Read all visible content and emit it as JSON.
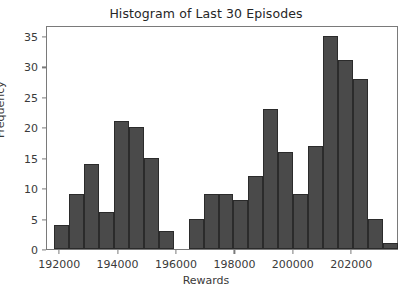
{
  "chart_data": {
    "type": "bar",
    "title": "Histogram of Last 30 Episodes",
    "xlabel": "Rewards",
    "ylabel": "Frequency",
    "ylim": [
      0,
      36.8
    ],
    "xlim": [
      191550,
      203600
    ],
    "yticks": [
      0,
      5,
      10,
      15,
      20,
      25,
      30,
      35
    ],
    "ytick_labels": [
      "0",
      "5",
      "10",
      "15",
      "20",
      "25",
      "30",
      "35"
    ],
    "xticks": [
      192000,
      194000,
      196000,
      198000,
      200000,
      202000
    ],
    "xtick_labels": [
      "192000",
      "194000",
      "196000",
      "198000",
      "200000",
      "202000"
    ],
    "grid": false,
    "legend": null,
    "bin_width": 512,
    "bar_color": "#4a4a4a",
    "bar_edge_color": "#2b2b2b",
    "bins": [
      {
        "left": 191790,
        "right": 192302,
        "value": 4
      },
      {
        "left": 192302,
        "right": 192814,
        "value": 9
      },
      {
        "left": 192814,
        "right": 193326,
        "value": 14
      },
      {
        "left": 193326,
        "right": 193838,
        "value": 6
      },
      {
        "left": 193838,
        "right": 194350,
        "value": 21
      },
      {
        "left": 194350,
        "right": 194862,
        "value": 20
      },
      {
        "left": 194862,
        "right": 195374,
        "value": 15
      },
      {
        "left": 195374,
        "right": 195886,
        "value": 3
      },
      {
        "left": 195886,
        "right": 196398,
        "value": 0
      },
      {
        "left": 196398,
        "right": 196910,
        "value": 5
      },
      {
        "left": 196910,
        "right": 197422,
        "value": 9
      },
      {
        "left": 197422,
        "right": 197934,
        "value": 9
      },
      {
        "left": 197934,
        "right": 198446,
        "value": 8
      },
      {
        "left": 198446,
        "right": 198958,
        "value": 12
      },
      {
        "left": 198958,
        "right": 199470,
        "value": 23
      },
      {
        "left": 199470,
        "right": 199982,
        "value": 16
      },
      {
        "left": 199982,
        "right": 200494,
        "value": 9
      },
      {
        "left": 200494,
        "right": 201006,
        "value": 17
      },
      {
        "left": 201006,
        "right": 201518,
        "value": 35
      },
      {
        "left": 201518,
        "right": 202030,
        "value": 31
      },
      {
        "left": 202030,
        "right": 202542,
        "value": 28
      },
      {
        "left": 202542,
        "right": 203054,
        "value": 5
      },
      {
        "left": 203054,
        "right": 203566,
        "value": 1
      }
    ],
    "values": [
      4,
      9,
      14,
      6,
      21,
      20,
      15,
      3,
      0,
      5,
      9,
      9,
      8,
      12,
      23,
      16,
      9,
      17,
      35,
      31,
      28,
      5,
      1
    ]
  }
}
